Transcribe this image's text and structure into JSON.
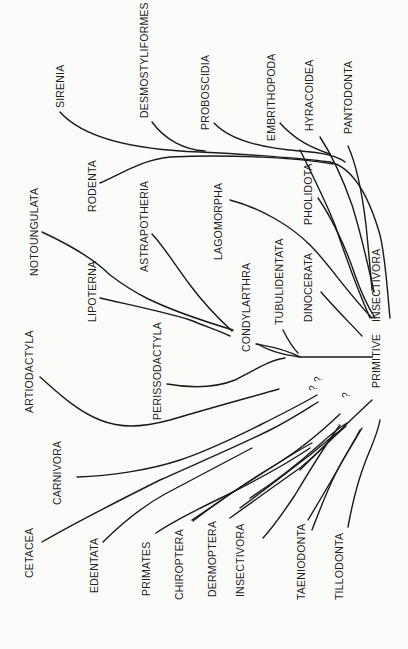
{
  "diagram": {
    "root": "PRIMITIVE INSECTIVORA",
    "root_parts": [
      "PRIMITIVE",
      "INSECTIVORA"
    ],
    "upper_groups": [
      "SIRENIA",
      "DESMOSTYLIFORMES",
      "PROBOSCIDIA",
      "EMBRITHOPODA",
      "HYRACOIDEA",
      "PANTODONTA",
      "RODENTA",
      "LAGOMORPHA",
      "PHOLIDOTA",
      "DINOCERATA",
      "TUBULIDENTATA"
    ],
    "condylarthra_group": {
      "node": "CONDYLARTHRA",
      "children": [
        "NOTOUNGULATA",
        "LIPOTERNA",
        "ASTRAPOTHERIA",
        "PERISSODACTYLA"
      ]
    },
    "lower_groups": [
      "ARTIODACTYLA",
      "CARNIVORA",
      "CETACEA",
      "EDENTATA",
      "PRIMATES",
      "CHIROPTERA",
      "DERMOPTERA",
      "INSECTIVORA",
      "TAENIODONTA",
      "TILLODONTA"
    ],
    "uncertain_marks": [
      "?",
      "?",
      "?"
    ],
    "labels": {
      "sirenia": "SIRENIA",
      "desmostyliformes": "DESMOSTYLIFORMES",
      "proboscidia": "PROBOSCIDIA",
      "embrithopoda": "EMBRITHOPODA",
      "hyracoidea": "HYRACOIDEA",
      "pantodonta": "PANTODONTA",
      "rodenta": "RODENTA",
      "lagomorpha": "LAGOMORPHA",
      "pholidota": "PHOLIDOTA",
      "dinocerata": "DINOCERATA",
      "tubulidentata": "TUBULIDENTATA",
      "notoungulata": "NOTOUNGULATA",
      "lipoterna": "LIPOTERNA",
      "astrapotheria": "ASTRAPOTHERIA",
      "condylarthra": "CONDYLARTHRA",
      "perissodactyla": "PERISSODACTYLA",
      "artiodactyla": "ARTIODACTYLA",
      "carnivora": "CARNIVORA",
      "cetacea": "CETACEA",
      "edentata": "EDENTATA",
      "primates": "PRIMATES",
      "chiroptera": "CHIROPTERA",
      "dermoptera": "DERMOPTERA",
      "insectivora": "INSECTIVORA",
      "taeniodonta": "TAENIODONTA",
      "tillodonta": "TILLODONTA",
      "primitive": "PRIMITIVE",
      "primitive_insectivora": "INSECTIVORA",
      "q": "?"
    }
  }
}
